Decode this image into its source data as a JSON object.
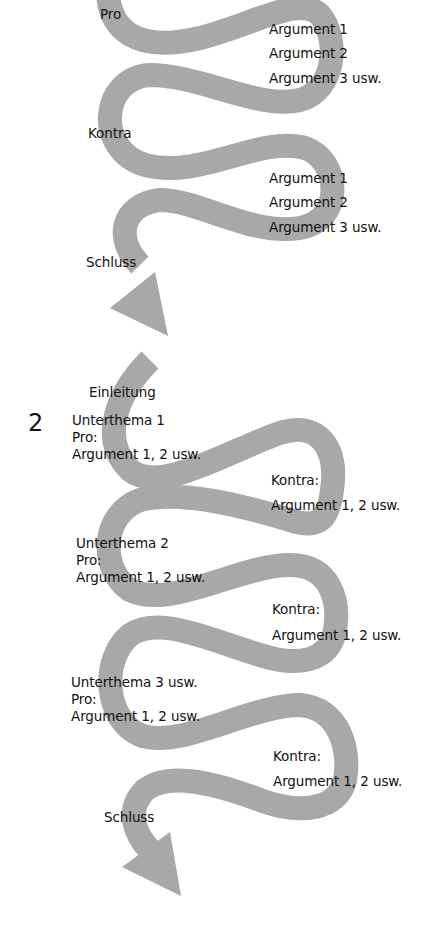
{
  "colors": {
    "band": "#a8a8a8",
    "text": "#111111",
    "background": "#ffffff"
  },
  "part1": {
    "pro_label": "Pro",
    "pro_arguments": [
      "Argument 1",
      "Argument 2",
      "Argument 3 usw."
    ],
    "contra_label": "Kontra",
    "contra_arguments": [
      "Argument 1",
      "Argument 2",
      "Argument 3 usw."
    ],
    "conclusion_label": "Schluss"
  },
  "part2": {
    "number": "2",
    "intro_label": "Einleitung",
    "subtopics": [
      {
        "title": "Unterthema 1",
        "pro_label": "Pro:",
        "pro_args": "Argument 1, 2 usw.",
        "contra_label": "Kontra:",
        "contra_args": "Argument 1, 2 usw."
      },
      {
        "title": "Unterthema 2",
        "pro_label": "Pro:",
        "pro_args": "Argument 1, 2 usw.",
        "contra_label": "Kontra:",
        "contra_args": "Argument 1, 2 usw."
      },
      {
        "title": "Unterthema 3 usw.",
        "pro_label": "Pro:",
        "pro_args": "Argument 1, 2 usw.",
        "contra_label": "Kontra:",
        "contra_args": "Argument 1, 2 usw."
      }
    ],
    "conclusion_label": "Schluss"
  }
}
